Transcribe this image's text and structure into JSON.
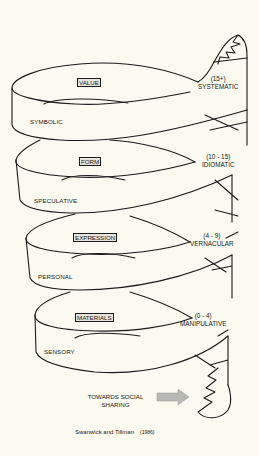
{
  "levels": [
    {
      "layer": "VALUE",
      "inner_mode": "SYMBOLIC",
      "outer_mode": "SYSTEMATIC",
      "age": "(15+)"
    },
    {
      "layer": "FORM",
      "inner_mode": "SPECULATIVE",
      "outer_mode": "IDIOMATIC",
      "age": "(10 - 15)"
    },
    {
      "layer": "EXPRESSION",
      "inner_mode": "PERSONAL",
      "outer_mode": "VERNACULAR",
      "age": "(4 - 9)"
    },
    {
      "layer": "MATERIALS",
      "inner_mode": "SENSORY",
      "outer_mode": "MANIPULATIVE",
      "age": "(0 - 4)"
    }
  ],
  "bottom": {
    "line1": "TOWARDS SOCIAL",
    "line2": "SHARING",
    "arrow_icon": "right-arrow-icon"
  },
  "credit": {
    "authors": "Swanwick and Tillman",
    "year": "(1986)"
  },
  "colors": {
    "background": "#fbfaf0",
    "ink": "#1a1a1a",
    "arrow": "#b8b8b4"
  }
}
